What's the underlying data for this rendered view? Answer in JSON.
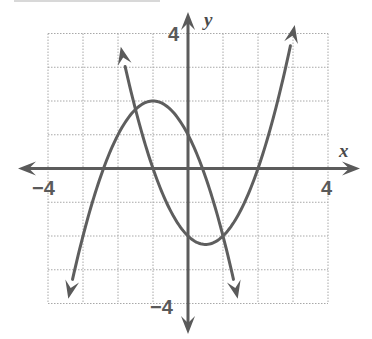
{
  "chart_data": {
    "type": "line",
    "title": "",
    "xlabel": "x",
    "ylabel": "y",
    "xlim": [
      -4,
      4
    ],
    "ylim": [
      -4,
      4
    ],
    "grid": true,
    "grid_step": 1,
    "tick_labels": {
      "x_min": "−4",
      "x_max": "4",
      "y_max": "4",
      "y_min": "−4"
    },
    "series": [
      {
        "name": "downward parabola",
        "equation": "y = -x^2 - 2x + 1",
        "vertex": [
          -1,
          2
        ],
        "x_intercepts": [
          -2.41,
          0.41
        ],
        "y_intercept": 1,
        "x": [
          -3.4,
          -3,
          -2.41,
          -2,
          -1.5,
          -1,
          -0.5,
          0,
          0.41,
          1,
          1.4
        ],
        "y": [
          -3.76,
          -2,
          0,
          1,
          1.75,
          2,
          1.75,
          1,
          0,
          -2,
          -3.76
        ],
        "arrows": "both ends"
      },
      {
        "name": "upward parabola",
        "equation": "y = x^2 - x - 2",
        "vertex": [
          0.5,
          -2.25
        ],
        "x_intercepts": [
          -1,
          2
        ],
        "y_intercept": -2,
        "x": [
          -1.9,
          -1.5,
          -1,
          0,
          0.5,
          1,
          2,
          2.5,
          3.05
        ],
        "y": [
          3.51,
          1.75,
          0,
          -2,
          -2.25,
          -2,
          0,
          1.75,
          4.25
        ],
        "arrows": "both ends"
      }
    ],
    "intersections": [
      [
        -1.5,
        1.75
      ],
      [
        1,
        -2
      ]
    ],
    "legend": null
  },
  "labels": {
    "x_axis": "x",
    "y_axis": "y",
    "x_min": "−4",
    "x_max": "4",
    "y_max": "4",
    "y_min": "−4"
  }
}
